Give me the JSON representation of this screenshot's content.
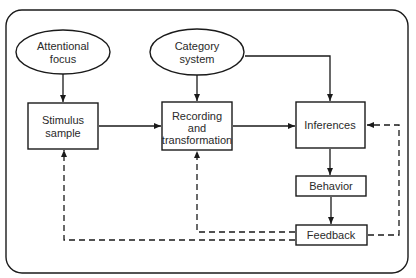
{
  "diagram": {
    "nodes": {
      "attentional_focus": {
        "line1": "Attentional",
        "line2": "focus",
        "shape": "ellipse"
      },
      "category_system": {
        "line1": "Category",
        "line2": "system",
        "shape": "ellipse"
      },
      "stimulus_sample": {
        "line1": "Stimulus",
        "line2": "sample",
        "shape": "rect"
      },
      "recording": {
        "line1": "Recording",
        "line2": "and",
        "line3": "transformation",
        "shape": "rect"
      },
      "inferences": {
        "line1": "Inferences",
        "shape": "rect"
      },
      "behavior": {
        "line1": "Behavior",
        "shape": "rect"
      },
      "feedback": {
        "line1": "Feedback",
        "shape": "rect"
      }
    },
    "edges": [
      {
        "from": "Attentional focus",
        "to": "Stimulus sample",
        "style": "solid"
      },
      {
        "from": "Category system",
        "to": "Recording and transformation",
        "style": "solid"
      },
      {
        "from": "Category system",
        "to": "Inferences",
        "style": "solid"
      },
      {
        "from": "Stimulus sample",
        "to": "Recording and transformation",
        "style": "solid"
      },
      {
        "from": "Recording and transformation",
        "to": "Inferences",
        "style": "solid"
      },
      {
        "from": "Inferences",
        "to": "Behavior",
        "style": "solid"
      },
      {
        "from": "Behavior",
        "to": "Feedback",
        "style": "solid"
      },
      {
        "from": "Feedback",
        "to": "Inferences",
        "style": "dashed"
      },
      {
        "from": "Feedback",
        "to": "Recording and transformation",
        "style": "dashed"
      },
      {
        "from": "Feedback",
        "to": "Stimulus sample",
        "style": "dashed"
      }
    ],
    "colors": {
      "stroke": "#1a1a1a",
      "text": "#2a2a2a",
      "background": "#ffffff"
    }
  }
}
